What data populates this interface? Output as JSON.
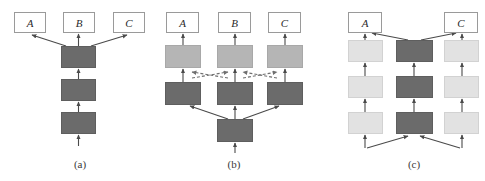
{
  "figure": {
    "background_color": "#ffffff",
    "width": 485,
    "height": 181,
    "colors": {
      "dark_block": "#6b6b6b",
      "mid_block": "#b5b5b5",
      "light_block": "#e2e2e2",
      "box_border": "#9a9a9a",
      "arrow": "#4a4a4a",
      "dashed_arrow": "#6f6f6f",
      "text": "#2b2b2b"
    }
  },
  "panels": [
    {
      "id": "panel-a",
      "caption": "(a)",
      "caption_x": 60,
      "caption_y": 158,
      "output_boxes": [
        {
          "label": "A",
          "x": 14,
          "y": 12,
          "w": 32,
          "h": 21
        },
        {
          "label": "B",
          "x": 63,
          "y": 12,
          "w": 32,
          "h": 21
        },
        {
          "label": "C",
          "x": 113,
          "y": 12,
          "w": 32,
          "h": 21
        }
      ],
      "blocks": [
        {
          "shade": "dark",
          "x": 61,
          "y": 46,
          "w": 35,
          "h": 22
        },
        {
          "shade": "dark",
          "x": 61,
          "y": 79,
          "w": 35,
          "h": 22
        },
        {
          "shade": "dark",
          "x": 61,
          "y": 112,
          "w": 35,
          "h": 22
        }
      ],
      "arrows": [
        {
          "kind": "solid",
          "x1": 78.5,
          "y1": 146,
          "x2": 78.5,
          "y2": 135
        },
        {
          "kind": "solid",
          "x1": 78.5,
          "y1": 112,
          "x2": 78.5,
          "y2": 102
        },
        {
          "kind": "solid",
          "x1": 78.5,
          "y1": 79,
          "x2": 78.5,
          "y2": 69
        },
        {
          "kind": "solid",
          "x1": 78.5,
          "y1": 46,
          "x2": 78.5,
          "y2": 34
        },
        {
          "kind": "solid",
          "x1": 66,
          "y1": 46,
          "x2": 32,
          "y2": 35
        },
        {
          "kind": "solid",
          "x1": 91,
          "y1": 46,
          "x2": 127,
          "y2": 35
        }
      ]
    },
    {
      "id": "panel-b",
      "caption": "(b)",
      "caption_x": 214,
      "caption_y": 158,
      "output_boxes": [
        {
          "label": "A",
          "x": 166,
          "y": 12,
          "w": 33,
          "h": 21
        },
        {
          "label": "B",
          "x": 218,
          "y": 12,
          "w": 33,
          "h": 21
        },
        {
          "label": "C",
          "x": 268,
          "y": 12,
          "w": 33,
          "h": 21
        }
      ],
      "blocks": [
        {
          "shade": "mid",
          "x": 165,
          "y": 45,
          "w": 36,
          "h": 23
        },
        {
          "shade": "mid",
          "x": 217,
          "y": 45,
          "w": 36,
          "h": 23
        },
        {
          "shade": "mid",
          "x": 267,
          "y": 45,
          "w": 36,
          "h": 23
        },
        {
          "shade": "dark",
          "x": 165,
          "y": 82,
          "w": 36,
          "h": 23
        },
        {
          "shade": "dark",
          "x": 217,
          "y": 82,
          "w": 36,
          "h": 23
        },
        {
          "shade": "dark",
          "x": 267,
          "y": 82,
          "w": 36,
          "h": 23
        },
        {
          "shade": "dark",
          "x": 217,
          "y": 119,
          "w": 36,
          "h": 23
        }
      ],
      "arrows": [
        {
          "kind": "solid",
          "x1": 183,
          "y1": 45,
          "x2": 183,
          "y2": 34
        },
        {
          "kind": "solid",
          "x1": 235,
          "y1": 45,
          "x2": 235,
          "y2": 34
        },
        {
          "kind": "solid",
          "x1": 285,
          "y1": 45,
          "x2": 285,
          "y2": 34
        },
        {
          "kind": "solid",
          "x1": 183,
          "y1": 82,
          "x2": 183,
          "y2": 69
        },
        {
          "kind": "solid",
          "x1": 235,
          "y1": 82,
          "x2": 235,
          "y2": 69
        },
        {
          "kind": "solid",
          "x1": 285,
          "y1": 82,
          "x2": 285,
          "y2": 69
        },
        {
          "kind": "solid",
          "x1": 235,
          "y1": 153,
          "x2": 235,
          "y2": 143
        },
        {
          "kind": "solid",
          "x1": 235,
          "y1": 119,
          "x2": 235,
          "y2": 106
        },
        {
          "kind": "solid",
          "x1": 228,
          "y1": 119,
          "x2": 190,
          "y2": 106
        },
        {
          "kind": "solid",
          "x1": 243,
          "y1": 119,
          "x2": 279,
          "y2": 106
        }
      ],
      "dashed_arrows": [
        {
          "x1": 192,
          "y1": 78,
          "x2": 228,
          "y2": 72
        },
        {
          "x1": 228,
          "y1": 78,
          "x2": 192,
          "y2": 72
        },
        {
          "x1": 243,
          "y1": 78,
          "x2": 277,
          "y2": 72
        },
        {
          "x1": 277,
          "y1": 78,
          "x2": 243,
          "y2": 72
        }
      ]
    },
    {
      "id": "panel-c",
      "caption": "(c)",
      "caption_x": 394,
      "caption_y": 158,
      "output_boxes": [
        {
          "label": "A",
          "x": 348,
          "y": 12,
          "w": 34,
          "h": 21
        },
        {
          "label": "C",
          "x": 444,
          "y": 12,
          "w": 34,
          "h": 21
        }
      ],
      "blocks": [
        {
          "shade": "light",
          "x": 348,
          "y": 40,
          "w": 35,
          "h": 22
        },
        {
          "shade": "dark",
          "x": 396,
          "y": 40,
          "w": 37,
          "h": 22
        },
        {
          "shade": "light",
          "x": 444,
          "y": 40,
          "w": 35,
          "h": 22
        },
        {
          "shade": "light",
          "x": 348,
          "y": 76,
          "w": 35,
          "h": 22
        },
        {
          "shade": "dark",
          "x": 396,
          "y": 76,
          "w": 37,
          "h": 22
        },
        {
          "shade": "light",
          "x": 444,
          "y": 76,
          "w": 35,
          "h": 22
        },
        {
          "shade": "light",
          "x": 348,
          "y": 112,
          "w": 35,
          "h": 22
        },
        {
          "shade": "dark",
          "x": 396,
          "y": 112,
          "w": 37,
          "h": 22
        },
        {
          "shade": "light",
          "x": 444,
          "y": 112,
          "w": 35,
          "h": 22
        }
      ],
      "arrows": [
        {
          "kind": "solid",
          "x1": 365,
          "y1": 40,
          "x2": 365,
          "y2": 34
        },
        {
          "kind": "solid",
          "x1": 462,
          "y1": 40,
          "x2": 462,
          "y2": 34
        },
        {
          "kind": "solid",
          "x1": 408,
          "y1": 40,
          "x2": 372,
          "y2": 33
        },
        {
          "kind": "solid",
          "x1": 421,
          "y1": 40,
          "x2": 456,
          "y2": 33
        },
        {
          "kind": "solid",
          "x1": 365,
          "y1": 76,
          "x2": 365,
          "y2": 63
        },
        {
          "kind": "solid",
          "x1": 414,
          "y1": 76,
          "x2": 414,
          "y2": 63
        },
        {
          "kind": "solid",
          "x1": 462,
          "y1": 76,
          "x2": 462,
          "y2": 63
        },
        {
          "kind": "solid",
          "x1": 365,
          "y1": 112,
          "x2": 365,
          "y2": 99
        },
        {
          "kind": "solid",
          "x1": 414,
          "y1": 112,
          "x2": 414,
          "y2": 99
        },
        {
          "kind": "solid",
          "x1": 462,
          "y1": 112,
          "x2": 462,
          "y2": 99
        },
        {
          "kind": "solid",
          "x1": 365,
          "y1": 148,
          "x2": 365,
          "y2": 135
        },
        {
          "kind": "solid",
          "x1": 462,
          "y1": 148,
          "x2": 462,
          "y2": 135
        },
        {
          "kind": "solid",
          "x1": 367,
          "y1": 148,
          "x2": 408,
          "y2": 136
        },
        {
          "kind": "solid",
          "x1": 460,
          "y1": 148,
          "x2": 420,
          "y2": 136
        }
      ]
    }
  ]
}
